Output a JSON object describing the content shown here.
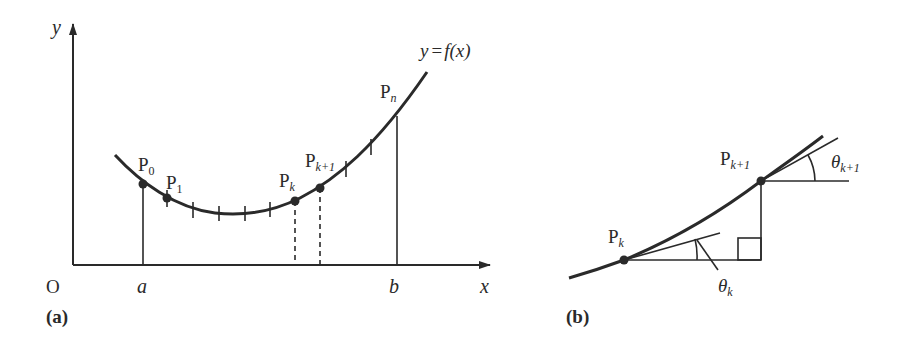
{
  "panel_a": {
    "label": "(a)",
    "axes": {
      "y_label": "y",
      "x_label": "x",
      "origin_label": "O",
      "a_label": "a",
      "b_label": "b"
    },
    "curve_label": "y = f(x)",
    "curve_label_parts": {
      "lhs": "y",
      "eq": "=",
      "rhs": "f(x)"
    },
    "points": [
      {
        "name": "P0",
        "base": "P",
        "sub": "0"
      },
      {
        "name": "P1",
        "base": "P",
        "sub": "1"
      },
      {
        "name": "Pk",
        "base": "P",
        "sub": "k"
      },
      {
        "name": "Pk+1",
        "base": "P",
        "sub": "k+1"
      },
      {
        "name": "Pn",
        "base": "P",
        "sub": "n"
      }
    ]
  },
  "panel_b": {
    "label": "(b)",
    "points": [
      {
        "name": "Pk",
        "base": "P",
        "sub": "k"
      },
      {
        "name": "Pk+1",
        "base": "P",
        "sub": "k+1"
      }
    ],
    "angles": [
      {
        "name": "theta_k",
        "symbol": "θ",
        "sub": "k"
      },
      {
        "name": "theta_k+1",
        "symbol": "θ",
        "sub": "k+1"
      }
    ]
  },
  "colors": {
    "stroke": "#2a2a2a",
    "background": "#ffffff"
  }
}
